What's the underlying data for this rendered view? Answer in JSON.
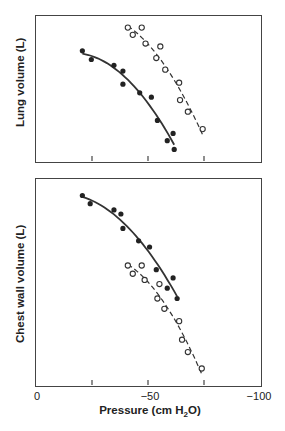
{
  "chart_data": [
    {
      "type": "scatter",
      "panel": "top",
      "title": "",
      "xlabel": "Pressure (cm H2O)",
      "ylabel": "Lung volume (L)",
      "xlim": [
        0,
        -100
      ],
      "xticks": [
        0,
        -25,
        -50,
        -75,
        -100
      ],
      "xtick_labels": [
        "0",
        "",
        "-50",
        "",
        "-100"
      ],
      "y_relative_note": "no y ticks; y given as fraction of plot height (0=bottom,1=top)",
      "series": [
        {
          "name": "filled circles (solid fit)",
          "marker": "filled-circle",
          "line": "solid",
          "points": [
            [
              -20.7,
              0.76
            ],
            [
              -24.7,
              0.7
            ],
            [
              -34.8,
              0.66
            ],
            [
              -38.8,
              0.62
            ],
            [
              -38.8,
              0.53
            ],
            [
              -46.3,
              0.47
            ],
            [
              -51.5,
              0.44
            ],
            [
              -54.2,
              0.28
            ],
            [
              -61.2,
              0.19
            ],
            [
              -58.6,
              0.14
            ],
            [
              -61.7,
              0.08
            ]
          ]
        },
        {
          "name": "open circles (dashed fit)",
          "marker": "open-circle",
          "line": "dashed",
          "points": [
            [
              -41.0,
              0.92
            ],
            [
              -47.2,
              0.92
            ],
            [
              -43.2,
              0.87
            ],
            [
              -48.9,
              0.81
            ],
            [
              -55.5,
              0.79
            ],
            [
              -53.7,
              0.71
            ],
            [
              -57.7,
              0.63
            ],
            [
              -63.9,
              0.54
            ],
            [
              -64.3,
              0.42
            ],
            [
              -67.8,
              0.34
            ],
            [
              -74.4,
              0.22
            ]
          ]
        }
      ]
    },
    {
      "type": "scatter",
      "panel": "bottom",
      "title": "",
      "xlabel": "Pressure (cm H2O)",
      "ylabel": "Chest wall volume (L)",
      "xlim": [
        0,
        -100
      ],
      "xticks": [
        0,
        -25,
        -50,
        -75,
        -100
      ],
      "xtick_labels": [
        "0",
        "",
        "-50",
        "",
        "-100"
      ],
      "y_relative_note": "no y ticks; y given as fraction of plot height (0=bottom,1=top)",
      "series": [
        {
          "name": "filled circles (solid fit)",
          "marker": "filled-circle",
          "line": "solid",
          "points": [
            [
              -20.7,
              0.92
            ],
            [
              -24.2,
              0.88
            ],
            [
              -34.8,
              0.85
            ],
            [
              -37.9,
              0.83
            ],
            [
              -38.8,
              0.76
            ],
            [
              -45.8,
              0.7
            ],
            [
              -50.7,
              0.67
            ],
            [
              -53.7,
              0.56
            ],
            [
              -61.2,
              0.52
            ],
            [
              -58.6,
              0.47
            ],
            [
              -63.0,
              0.42
            ]
          ]
        },
        {
          "name": "open circles (dashed fit)",
          "marker": "open-circle",
          "line": "dashed",
          "points": [
            [
              -41.0,
              0.58
            ],
            [
              -47.2,
              0.58
            ],
            [
              -43.2,
              0.54
            ],
            [
              -48.5,
              0.51
            ],
            [
              -55.1,
              0.49
            ],
            [
              -54.2,
              0.42
            ],
            [
              -57.3,
              0.37
            ],
            [
              -63.9,
              0.31
            ],
            [
              -65.2,
              0.22
            ],
            [
              -67.8,
              0.16
            ],
            [
              -74.0,
              0.08
            ]
          ]
        }
      ]
    }
  ],
  "labels": {
    "top_ylabel": "Lung volume (L)",
    "bottom_ylabel": "Chest wall volume (L)",
    "xlabel_main": "Pressure (cm H",
    "xlabel_sub": "2",
    "xlabel_end": "O)",
    "xtick_0": "0",
    "xtick_50": "−50",
    "xtick_100": "−100"
  }
}
